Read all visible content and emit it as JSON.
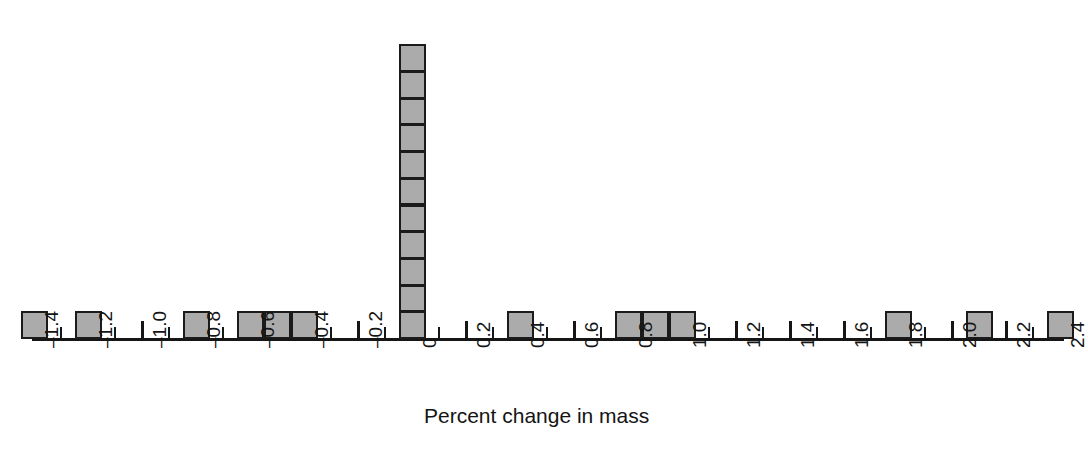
{
  "chart_data": {
    "type": "bar",
    "subtype": "stacked-dot-histogram",
    "title": "",
    "xlabel": "Percent change in mass",
    "ylabel": "",
    "xlim": [
      -1.45,
      2.45
    ],
    "ylim": [
      0,
      11
    ],
    "bin_width": 0.1,
    "grid": false,
    "legend": null,
    "tick_step": 0.1,
    "x_tick_values": [
      -1.4,
      -1.3,
      -1.2,
      -1.1,
      -1.0,
      -0.9,
      -0.8,
      -0.7,
      -0.6,
      -0.5,
      -0.4,
      -0.3,
      -0.2,
      -0.1,
      0,
      0.1,
      0.2,
      0.3,
      0.4,
      0.5,
      0.6,
      0.7,
      0.8,
      0.9,
      1.0,
      1.1,
      1.2,
      1.3,
      1.4,
      1.5,
      1.6,
      1.7,
      1.8,
      1.9,
      2.0,
      2.1,
      2.2,
      2.3,
      2.4
    ],
    "x_labeled_ticks": [
      {
        "value": -1.4,
        "label": "–1.4"
      },
      {
        "value": -1.2,
        "label": "–1.2"
      },
      {
        "value": -1.0,
        "label": "–1.0"
      },
      {
        "value": -0.8,
        "label": "–0.8"
      },
      {
        "value": -0.6,
        "label": "–0.6"
      },
      {
        "value": -0.4,
        "label": "–0.4"
      },
      {
        "value": -0.2,
        "label": "–0.2"
      },
      {
        "value": 0,
        "label": "0"
      },
      {
        "value": 0.2,
        "label": "0.2"
      },
      {
        "value": 0.4,
        "label": "0.4"
      },
      {
        "value": 0.6,
        "label": "0.6"
      },
      {
        "value": 0.8,
        "label": "0.8"
      },
      {
        "value": 1.0,
        "label": "1.0"
      },
      {
        "value": 1.2,
        "label": "1.2"
      },
      {
        "value": 1.4,
        "label": "1.4"
      },
      {
        "value": 1.6,
        "label": "1.6"
      },
      {
        "value": 1.8,
        "label": "1.8"
      },
      {
        "value": 2.0,
        "label": "2.0"
      },
      {
        "value": 2.2,
        "label": "2.2"
      },
      {
        "value": 2.4,
        "label": "2.4"
      }
    ],
    "categories": [
      -1.4,
      -1.3,
      -1.2,
      -1.1,
      -1.0,
      -0.9,
      -0.8,
      -0.7,
      -0.6,
      -0.5,
      -0.4,
      -0.3,
      -0.2,
      -0.1,
      0,
      0.1,
      0.2,
      0.3,
      0.4,
      0.5,
      0.6,
      0.7,
      0.8,
      0.9,
      1.0,
      1.1,
      1.2,
      1.3,
      1.4,
      1.5,
      1.6,
      1.7,
      1.8,
      1.9,
      2.0,
      2.1,
      2.2,
      2.3,
      2.4
    ],
    "values": [
      1,
      0,
      1,
      0,
      0,
      0,
      1,
      0,
      1,
      1,
      1,
      0,
      0,
      0,
      11,
      0,
      0,
      0,
      1,
      0,
      0,
      0,
      1,
      1,
      1,
      0,
      0,
      0,
      0,
      0,
      0,
      0,
      1,
      0,
      0,
      1,
      0,
      0,
      1
    ],
    "total_count": 23,
    "bars": [
      {
        "x": -1.4,
        "count": 1
      },
      {
        "x": -1.2,
        "count": 1
      },
      {
        "x": -0.8,
        "count": 1
      },
      {
        "x": -0.6,
        "count": 1
      },
      {
        "x": -0.5,
        "count": 1
      },
      {
        "x": -0.4,
        "count": 1
      },
      {
        "x": 0,
        "count": 11
      },
      {
        "x": 0.4,
        "count": 1
      },
      {
        "x": 0.8,
        "count": 1
      },
      {
        "x": 0.9,
        "count": 1
      },
      {
        "x": 1.0,
        "count": 1
      },
      {
        "x": 1.8,
        "count": 1
      },
      {
        "x": 2.1,
        "count": 1
      },
      {
        "x": 2.4,
        "count": 1
      }
    ],
    "colors": {
      "box_fill": "#ababab",
      "box_border": "#1b1b1b",
      "axis": "#161616",
      "text": "#141414",
      "background": "#ffffff"
    }
  }
}
